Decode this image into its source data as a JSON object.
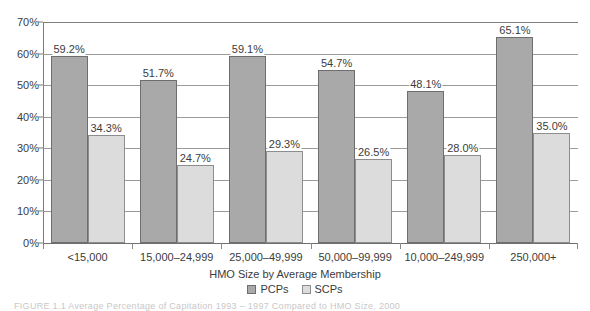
{
  "chart_data": {
    "type": "bar",
    "title": "",
    "xlabel": "HMO Size by Average Membership",
    "ylabel": "",
    "ylim": [
      0,
      70
    ],
    "ytick_step": 10,
    "ytick_labels": [
      "0%",
      "10%",
      "20%",
      "30%",
      "40%",
      "50%",
      "60%",
      "70%"
    ],
    "ytick_values": [
      0,
      10,
      20,
      30,
      40,
      50,
      60,
      70
    ],
    "grid": true,
    "legend_position": "bottom-center",
    "categories": [
      "<15,000",
      "15,000–24,999",
      "25,000–49,999",
      "50,000–99,999",
      "10,000–249,999",
      "250,000+"
    ],
    "series": [
      {
        "name": "PCPs",
        "color": "#a9a9a9",
        "values": [
          59.2,
          51.7,
          59.1,
          54.7,
          48.1,
          65.1
        ],
        "labels": [
          "59.2%",
          "51.7%",
          "59.1%",
          "54.7%",
          "48.1%",
          "65.1%"
        ]
      },
      {
        "name": "SCPs",
        "color": "#dcdcdc",
        "values": [
          34.3,
          24.7,
          29.3,
          26.5,
          28.0,
          35.0
        ],
        "labels": [
          "34.3%",
          "24.7%",
          "29.3%",
          "26.5%",
          "28.0%",
          "35.0%"
        ]
      }
    ]
  },
  "legend": {
    "items": [
      {
        "label": "PCPs",
        "swatch": "pcp"
      },
      {
        "label": "SCPs",
        "swatch": "scp"
      }
    ]
  },
  "caption": {
    "text": "FIGURE 1.1  Average Percentage of Capitation 1993 – 1997 Compared to HMO Size, 2000"
  }
}
